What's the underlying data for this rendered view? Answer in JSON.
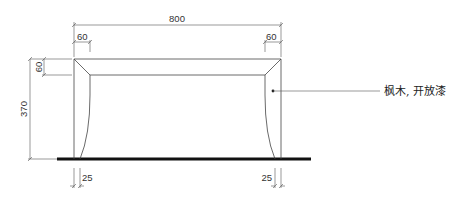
{
  "drawing": {
    "type": "furniture-elevation",
    "colors": {
      "line": "#444444",
      "floor": "#111111",
      "text": "#333333",
      "background": "#ffffff"
    }
  },
  "dimensions": {
    "overall_width": "800",
    "top_left_rail": "60",
    "top_right_rail": "60",
    "top_rail_height": "60",
    "overall_height": "370",
    "leg_bottom_left": "25",
    "leg_bottom_right": "25"
  },
  "annotation": {
    "material_label": "枫木, 开放漆"
  }
}
